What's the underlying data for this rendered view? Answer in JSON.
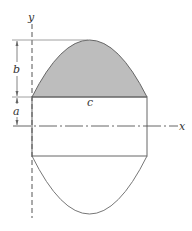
{
  "diagram": {
    "labels": {
      "y_axis": "y",
      "x_axis": "x",
      "dim_b": "b",
      "dim_a": "a",
      "dim_c": "c"
    },
    "colors": {
      "shaded_fill": "#bdbdbd",
      "line": "#555555",
      "background": "#ffffff"
    }
  }
}
